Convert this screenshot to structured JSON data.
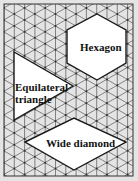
{
  "diagram": {
    "type": "isometric-grid-shapes",
    "background_color": "#e4e4e4",
    "grid_color": "#555555",
    "node_color": "#333333",
    "shape_fill": "#ffffff",
    "shape_stroke": "#1a1a1a",
    "shapes": [
      {
        "name": "Hexagon",
        "label": "Hexagon",
        "points": [
          [
            97,
            14
          ],
          [
            126,
            30
          ],
          [
            126,
            63
          ],
          [
            97,
            80
          ],
          [
            67,
            63
          ],
          [
            67,
            30
          ]
        ]
      },
      {
        "name": "Equilateral triangle",
        "label_line1": "Equilateral",
        "label_line2": "triangle",
        "points": [
          [
            14,
            52
          ],
          [
            73,
            86
          ],
          [
            14,
            120
          ]
        ]
      },
      {
        "name": "Wide diamond",
        "label": "Wide diamond",
        "points": [
          [
            25,
            142
          ],
          [
            74,
            118
          ],
          [
            126,
            142
          ],
          [
            74,
            170
          ]
        ]
      }
    ]
  }
}
